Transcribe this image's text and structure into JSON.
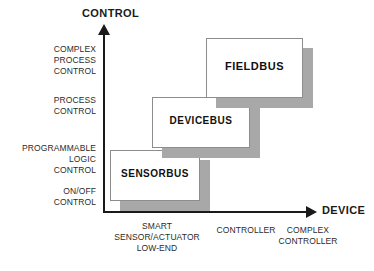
{
  "chart_data": {
    "type": "diagram",
    "title": "",
    "xlabel": "DEVICE",
    "ylabel": "CONTROL",
    "grid": false,
    "legend": "none",
    "y_tick_labels": [
      "COMPLEX\nPROCESS\nCONTROL",
      "PROCESS\nCONTROL",
      "PROGRAMMABLE\nLOGIC\nCONTROL",
      "ON/OFF\nCONTROL"
    ],
    "x_tick_labels": [
      "SMART\nSENSOR/ACTUATOR\nLOW-END",
      "CONTROLLER",
      "COMPLEX\nCONTROLLER"
    ],
    "boxes": [
      {
        "label": "SENSORBUS",
        "x_category": "SMART SENSOR/ACTUATOR LOW-END",
        "y_category": "ON/OFF CONTROL to PROGRAMMABLE LOGIC CONTROL",
        "rank": 1
      },
      {
        "label": "DEVICEBUS",
        "x_category": "CONTROLLER",
        "y_category": "PROGRAMMABLE LOGIC CONTROL to PROCESS CONTROL",
        "rank": 2
      },
      {
        "label": "FIELDBUS",
        "x_category": "COMPLEX CONTROLLER",
        "y_category": "PROCESS CONTROL to COMPLEX PROCESS CONTROL",
        "rank": 3
      }
    ],
    "colors": {
      "axis": "#1a1a1a",
      "box_fill": "#ffffff",
      "box_border": "#8d8d8d",
      "box_shadow": "#a8a8a8",
      "text": "#2b2b2b",
      "background": "#ffffff"
    }
  },
  "axes": {
    "y_title": "CONTROL",
    "x_title": "DEVICE"
  },
  "y_labels": [
    "COMPLEX\nPROCESS\nCONTROL",
    "PROCESS\nCONTROL",
    "PROGRAMMABLE\nLOGIC\nCONTROL",
    "ON/OFF\nCONTROL"
  ],
  "x_labels": [
    "SMART\nSENSOR/ACTUATOR\nLOW-END",
    "CONTROLLER",
    "COMPLEX\nCONTROLLER"
  ],
  "boxes": {
    "sensorbus": "SENSORBUS",
    "devicebus": "DEVICEBUS",
    "fieldbus": "FIELDBUS"
  }
}
